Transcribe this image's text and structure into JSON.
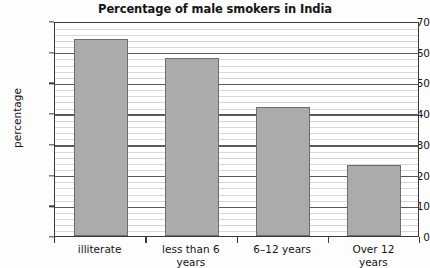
{
  "chart_data": {
    "type": "bar",
    "title": "Percentage of male smokers in India",
    "xlabel": "",
    "ylabel": "percentage",
    "categories": [
      "illiterate",
      "less than 6 years",
      "6–12 years",
      "Over 12 years"
    ],
    "category_lines": [
      [
        "illiterate"
      ],
      [
        "less than 6",
        "years"
      ],
      [
        "6–12 years"
      ],
      [
        "Over 12",
        "years"
      ]
    ],
    "values": [
      64,
      58,
      42,
      23
    ],
    "ylim": [
      0,
      70
    ],
    "ytick_values": [
      0,
      10,
      20,
      30,
      40,
      50,
      60,
      70
    ],
    "ytick_labels": [
      "0",
      "10",
      "20",
      "30",
      "40",
      "50",
      "60",
      "70"
    ],
    "minor_tick_step": 2,
    "grid": true,
    "legend": false,
    "bar_color": "#ababab",
    "bar_border_color": "#6d6d6d",
    "axis_color": "#3a3a3a",
    "major_grid_color": "#5a5a5a",
    "minor_grid_color": "#d7d7d7"
  }
}
